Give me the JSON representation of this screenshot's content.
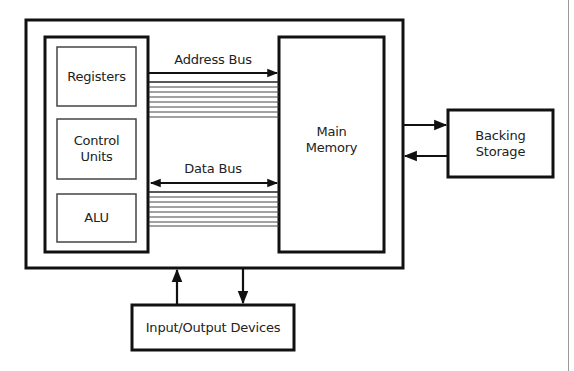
{
  "diagram": {
    "type": "computer-architecture-block-diagram",
    "cpu": {
      "components": [
        {
          "label": "Registers"
        },
        {
          "label": "Control\nUnits"
        },
        {
          "label": "ALU"
        }
      ]
    },
    "main_memory": {
      "label": "Main\nMemory"
    },
    "backing_storage": {
      "label": "Backing\nStorage"
    },
    "io_devices": {
      "label": "Input/Output Devices"
    },
    "buses": {
      "address": {
        "label": "Address Bus",
        "direction": "cpu-to-memory",
        "line_count": 8
      },
      "data": {
        "label": "Data Bus",
        "direction": "bidirectional",
        "line_count": 8
      }
    },
    "connections": [
      {
        "from": "computer",
        "to": "backing_storage",
        "direction": "right"
      },
      {
        "from": "backing_storage",
        "to": "computer",
        "direction": "left"
      },
      {
        "from": "io_devices",
        "to": "computer",
        "direction": "up"
      },
      {
        "from": "computer",
        "to": "io_devices",
        "direction": "down"
      }
    ],
    "colors": {
      "stroke": "#111111",
      "inner_stroke": "#444444",
      "background": "#ffffff"
    }
  }
}
